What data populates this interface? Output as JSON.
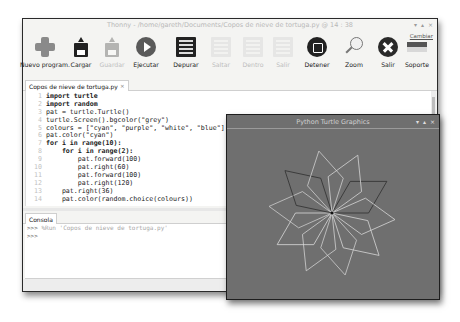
{
  "window": {
    "title": "Thonny - /home/gareth/Documents/Copos de nieve de tortuga.py @ 14 : 38",
    "controls": [
      "▾",
      "▴",
      "×"
    ]
  },
  "toolbar": {
    "buttons": [
      {
        "label": "Nuevo program.",
        "icon": "new-file-icon",
        "enabled": true
      },
      {
        "label": "Cargar",
        "icon": "load-icon",
        "enabled": true
      },
      {
        "label": "Guardar",
        "icon": "save-icon",
        "enabled": false
      },
      {
        "label": "Ejecutar",
        "icon": "run-icon",
        "enabled": true
      },
      {
        "label": "Depurar",
        "icon": "debug-icon",
        "enabled": true
      },
      {
        "label": "Saltar",
        "icon": "step-over-icon",
        "enabled": false
      },
      {
        "label": "Dentro",
        "icon": "step-into-icon",
        "enabled": false
      },
      {
        "label": "Salir",
        "icon": "step-out-icon",
        "enabled": false
      },
      {
        "label": "Detener",
        "icon": "stop-icon",
        "enabled": true
      },
      {
        "label": "Zoom",
        "icon": "zoom-icon",
        "enabled": true
      },
      {
        "label": "Salir",
        "icon": "quit-icon",
        "enabled": true
      },
      {
        "label": "Soporte",
        "icon": "support-flag-icon",
        "enabled": true
      }
    ],
    "corner_link": "Cambiar"
  },
  "editor": {
    "tab_label": "Copos de nieve de tortuga.py",
    "tab_close": "×",
    "line_numbers": [
      "1",
      "2",
      "3",
      "4",
      "5",
      "6",
      "7",
      "8",
      "9",
      "10",
      "11",
      "12",
      "13",
      "14"
    ],
    "lines": [
      "import turtle",
      "import random",
      "pat = turtle.Turtle()",
      "turtle.Screen().bgcolor(\"grey\")",
      "colours = [\"cyan\", \"purple\", \"white\", \"blue\"]",
      "pat.color(\"cyan\")",
      "for i in range(10):",
      "    for i in range(2):",
      "        pat.forward(100)",
      "        pat.right(60)",
      "        pat.forward(100)",
      "        pat.right(120)",
      "    pat.right(36)",
      "    pat.color(random.choice(colours))"
    ]
  },
  "console": {
    "tab_label": "Consola",
    "lines": [
      {
        "prompt": ">>>",
        "text": " %Run 'Copos de nieve de tortuga.py'"
      },
      {
        "prompt": ">>>",
        "text": ""
      }
    ]
  },
  "turtle_window": {
    "title": "Python Turtle Graphics",
    "controls": [
      "▾",
      "▴",
      "×"
    ],
    "background": "#6f6f6f",
    "petal_colors": [
      "#2e2e2e",
      "#d8d8d8",
      "#d8d8d8",
      "#cfcfcf",
      "#d2d2d2",
      "#dadada",
      "#cccccc",
      "#2e2e2e",
      "#d0d0d0",
      "#d6d6d6"
    ]
  }
}
